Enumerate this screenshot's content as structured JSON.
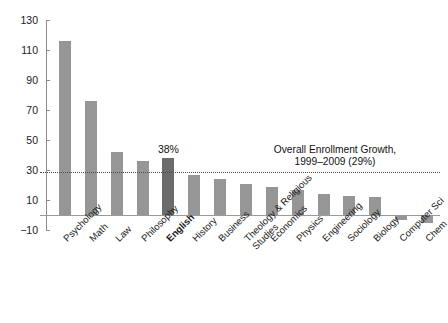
{
  "chart_data": {
    "type": "bar",
    "title": "",
    "subtitle": "",
    "xlabel": "",
    "ylabel": "",
    "ylim": [
      -10,
      130
    ],
    "yticks": [
      -10,
      10,
      30,
      50,
      70,
      90,
      110,
      130
    ],
    "ytick_labels": [
      "−10",
      "10",
      "30",
      "50",
      "70",
      "90",
      "110",
      "130"
    ],
    "grid": false,
    "legend": "none",
    "categories": [
      "Psychology",
      "Math",
      "Law",
      "Philosophy",
      "English",
      "History",
      "Business",
      "Theology & Religious\nStudies",
      "Economics",
      "Physics",
      "Engineering",
      "Sociology",
      "Biology",
      "Computer Sci",
      "Chem"
    ],
    "values": [
      116,
      76,
      42,
      36,
      38,
      27,
      24,
      21,
      19,
      17,
      14,
      13,
      12,
      -3,
      -5
    ],
    "highlight_category": "English",
    "highlight_label": "38%",
    "bar_color": "#969696",
    "highlight_color": "#6b6b6b",
    "reference_line": {
      "value": 29,
      "label_line1": "Overall Enrollment Growth,",
      "label_line2": "1999–2009 (29%)",
      "style": "dotted",
      "color": "#4a4a4a"
    }
  }
}
